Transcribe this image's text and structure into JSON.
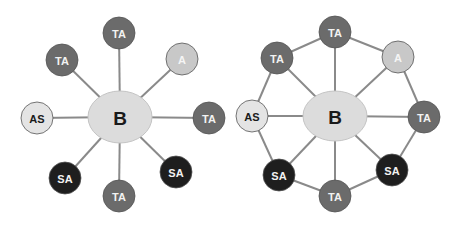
{
  "colors": {
    "background": "#ffffff",
    "edge": "#8a8a8a",
    "B": "#dcdcdc",
    "TA": "#6b6b6b",
    "A": "#c8c8c8",
    "AS": "#e4e4e4",
    "SA": "#1e1e1e",
    "text_dark": "#1a1a1a",
    "text_light": "#f2f2f2"
  },
  "diagrams": [
    {
      "name": "star-topology",
      "center": {
        "label": "B",
        "x": 120,
        "y": 117,
        "rx": 32,
        "ry": 26
      },
      "nodes": [
        {
          "label": "TA",
          "type": "TA",
          "x": 119,
          "y": 33
        },
        {
          "label": "A",
          "type": "A",
          "x": 182,
          "y": 59
        },
        {
          "label": "TA",
          "type": "TA",
          "x": 209,
          "y": 118
        },
        {
          "label": "SA",
          "type": "SA",
          "x": 176,
          "y": 172
        },
        {
          "label": "TA",
          "type": "TA",
          "x": 119,
          "y": 196
        },
        {
          "label": "SA",
          "type": "SA",
          "x": 65,
          "y": 178
        },
        {
          "label": "AS",
          "type": "AS",
          "x": 37,
          "y": 118
        },
        {
          "label": "TA",
          "type": "TA",
          "x": 62,
          "y": 60
        }
      ],
      "ring": false
    },
    {
      "name": "ring-star-topology",
      "center": {
        "label": "B",
        "x": 335,
        "y": 116,
        "rx": 32,
        "ry": 25
      },
      "nodes": [
        {
          "label": "TA",
          "type": "TA",
          "x": 335,
          "y": 32
        },
        {
          "label": "A",
          "type": "A",
          "x": 398,
          "y": 57
        },
        {
          "label": "TA",
          "type": "TA",
          "x": 424,
          "y": 117
        },
        {
          "label": "SA",
          "type": "SA",
          "x": 392,
          "y": 170
        },
        {
          "label": "TA",
          "type": "TA",
          "x": 335,
          "y": 196
        },
        {
          "label": "SA",
          "type": "SA",
          "x": 279,
          "y": 175
        },
        {
          "label": "AS",
          "type": "AS",
          "x": 252,
          "y": 116
        },
        {
          "label": "TA",
          "type": "TA",
          "x": 277,
          "y": 58
        }
      ],
      "ring": true
    }
  ]
}
